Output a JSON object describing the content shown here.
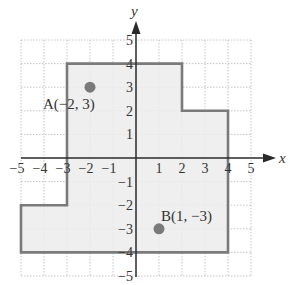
{
  "diagram": {
    "type": "coordinate-plane",
    "axes": {
      "x_label": "x",
      "y_label": "y",
      "x_range": [
        -5,
        5
      ],
      "y_range": [
        -5,
        5
      ]
    },
    "x_ticks": [
      "−5",
      "−4",
      "−3",
      "−2",
      "−1",
      "1",
      "2",
      "3",
      "4",
      "5"
    ],
    "y_ticks": [
      "5",
      "4",
      "3",
      "2",
      "1",
      "−1",
      "−2",
      "−3",
      "−4",
      "−5"
    ],
    "region": {
      "vertices": [
        [
          -3,
          4
        ],
        [
          2,
          4
        ],
        [
          2,
          2
        ],
        [
          4,
          2
        ],
        [
          4,
          -4
        ],
        [
          -5,
          -4
        ],
        [
          -5,
          -2
        ],
        [
          -3,
          -2
        ]
      ],
      "fill": "#ececec",
      "stroke": "#7a7a7a"
    },
    "points": [
      {
        "name": "A",
        "x": -2,
        "y": 3,
        "label": "A(−2, 3)",
        "color": "#7a7a7a"
      },
      {
        "name": "B",
        "x": 1,
        "y": -3,
        "label": "B(1, −3)",
        "color": "#7a7a7a"
      }
    ]
  }
}
